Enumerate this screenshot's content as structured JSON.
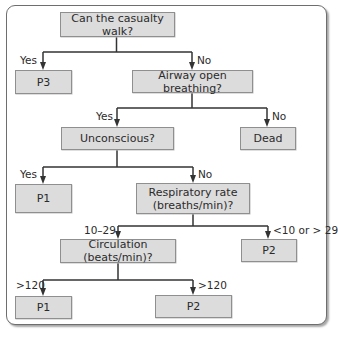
{
  "diagram": {
    "type": "triage flowchart",
    "colors": {
      "box_fill": "#dcdcdc",
      "box_border": "#8f8f8f",
      "line": "#333333",
      "frame": "#6e6e6e"
    },
    "nodes": {
      "walk": "Can the casualty walk?",
      "p3": "P3",
      "airway": "Airway open breathing?",
      "unconscious": "Unconscious?",
      "dead": "Dead",
      "p1_top": "P1",
      "resp_line1": "Respiratory rate",
      "resp_line2": "(breaths/min)?",
      "circulation": "Circulation (beats/min)?",
      "p2_right": "P2",
      "p1_bottom": "P1",
      "p2_bottom": "P2"
    },
    "edge_labels": {
      "walk_yes": "Yes",
      "walk_no": "No",
      "airway_yes": "Yes",
      "airway_no": "No",
      "uncon_yes": "Yes",
      "uncon_no": "No",
      "resp_normal": "10–29",
      "resp_abnormal": "<10 or > 29",
      "circ_left": ">120",
      "circ_right": ">120"
    },
    "edges": [
      {
        "from": "walk",
        "to": "p3",
        "label": "Yes"
      },
      {
        "from": "walk",
        "to": "airway",
        "label": "No"
      },
      {
        "from": "airway",
        "to": "unconscious",
        "label": "Yes"
      },
      {
        "from": "airway",
        "to": "dead",
        "label": "No"
      },
      {
        "from": "unconscious",
        "to": "p1_top",
        "label": "Yes"
      },
      {
        "from": "unconscious",
        "to": "resp",
        "label": "No"
      },
      {
        "from": "resp",
        "to": "circulation",
        "label": "10–29"
      },
      {
        "from": "resp",
        "to": "p2_right",
        "label": "<10 or > 29"
      },
      {
        "from": "circulation",
        "to": "p1_bottom",
        "label": ">120"
      },
      {
        "from": "circulation",
        "to": "p2_bottom",
        "label": ">120"
      }
    ]
  }
}
